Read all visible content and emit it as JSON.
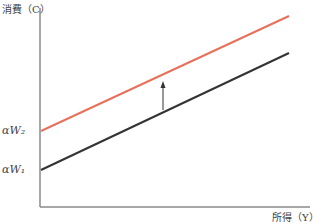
{
  "diagram": {
    "type": "line",
    "y_axis_label": "消費（C）",
    "x_axis_label": "所得（Y）",
    "intercept_labels": {
      "upper": "αW₂",
      "lower": "αW₁"
    },
    "lines": [
      {
        "name": "consumption-line-W2",
        "color": "#e8705a",
        "from": [
          41,
          131
        ],
        "to": [
          289,
          16
        ]
      },
      {
        "name": "consumption-line-W1",
        "color": "#333333",
        "from": [
          41,
          170
        ],
        "to": [
          289,
          53
        ]
      }
    ],
    "arrow": {
      "meaning": "upward shift",
      "x": 163,
      "from_y": 110,
      "to_y": 82
    },
    "axis_color": "#888888"
  }
}
